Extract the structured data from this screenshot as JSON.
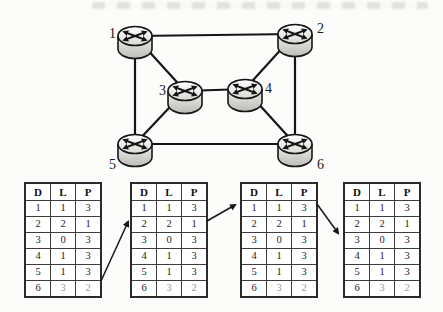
{
  "figure": {
    "background": "#fcfcfb",
    "ink_color": "#151515"
  },
  "chart_data": {
    "type": "diagram",
    "network": {
      "nodes": [
        {
          "id": "1",
          "label": "1",
          "x": 135,
          "y": 36,
          "label_dx": -19,
          "label_dy": 2,
          "label_anchor": "end"
        },
        {
          "id": "2",
          "label": "2",
          "x": 295,
          "y": 34,
          "label_dx": 22,
          "label_dy": -1,
          "label_anchor": "start"
        },
        {
          "id": "3",
          "label": "3",
          "x": 185,
          "y": 91,
          "label_dx": -19,
          "label_dy": 4,
          "label_anchor": "end"
        },
        {
          "id": "4",
          "label": "4",
          "x": 245,
          "y": 89,
          "label_dx": 20,
          "label_dy": 4,
          "label_anchor": "start"
        },
        {
          "id": "5",
          "label": "5",
          "x": 135,
          "y": 144,
          "label_dx": -19,
          "label_dy": 25,
          "label_anchor": "end"
        },
        {
          "id": "6",
          "label": "6",
          "x": 295,
          "y": 144,
          "label_dx": 22,
          "label_dy": 25,
          "label_anchor": "start"
        }
      ],
      "edges": [
        [
          "1",
          "2"
        ],
        [
          "1",
          "3"
        ],
        [
          "1",
          "5"
        ],
        [
          "2",
          "4"
        ],
        [
          "2",
          "6"
        ],
        [
          "3",
          "4"
        ],
        [
          "3",
          "5"
        ],
        [
          "4",
          "6"
        ],
        [
          "5",
          "6"
        ]
      ]
    },
    "routing_tables": {
      "columns": [
        "D",
        "L",
        "P"
      ],
      "rows": [
        [
          "1",
          "1",
          "3"
        ],
        [
          "2",
          "2",
          "1"
        ],
        [
          "3",
          "0",
          "3"
        ],
        [
          "4",
          "1",
          "3"
        ],
        [
          "5",
          "1",
          "3"
        ],
        [
          "6",
          "3",
          "2"
        ]
      ],
      "grayed_last_row_cols": [
        1,
        2
      ],
      "instances": [
        {
          "left": 24,
          "top": 182
        },
        {
          "left": 130,
          "top": 182
        },
        {
          "left": 240,
          "top": 182
        },
        {
          "left": 343,
          "top": 182
        }
      ]
    },
    "arrows": [
      {
        "x1": 101,
        "y1": 281,
        "x2": 128,
        "y2": 222
      },
      {
        "x1": 207,
        "y1": 221,
        "x2": 235,
        "y2": 205
      },
      {
        "x1": 317,
        "y1": 204,
        "x2": 338,
        "y2": 233
      }
    ]
  }
}
